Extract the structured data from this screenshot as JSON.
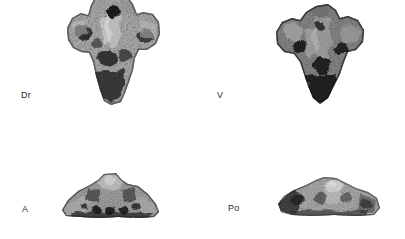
{
  "figure": {
    "type": "photographic-plate",
    "background_color": "#ffffff",
    "label_color": "#2b2b2b",
    "layout": "2 rows x 2 columns",
    "panels": [
      {
        "id": "dorsal",
        "label": "Dr",
        "view": "dorsal",
        "label_position": "left-of-specimen",
        "row": 1,
        "column": 1,
        "outline": "triangular, wide transverse processes at top, tapering ventrally",
        "tone": "mid-grey mottled, light highlights on ridges, dark pits",
        "crop": "top edge of specimen reaches image border"
      },
      {
        "id": "ventral",
        "label": "V",
        "view": "ventral",
        "label_position": "left-of-specimen",
        "row": 1,
        "column": 2,
        "outline": "triangular, broad lobed top, tapering to narrow base",
        "tone": "dark, coarse, heavily shadowed rugose surface",
        "crop": "fully contained"
      },
      {
        "id": "anterior",
        "label": "A",
        "view": "anterior",
        "label_position": "left-of-specimen",
        "row": 2,
        "column": 1,
        "outline": "wide low trapezoid, winged lateral processes, central dome",
        "tone": "mid-grey with dark circular foramina along lower margin",
        "crop": "fully contained"
      },
      {
        "id": "posterior",
        "label": "Po",
        "view": "posterior",
        "label_position": "left-of-specimen",
        "row": 2,
        "column": 2,
        "outline": "low wide arch, peaked centre, tapering lateral margins",
        "tone": "light-to-mid grey, bright highlight at apex, dark left margin",
        "crop": "fully contained"
      }
    ]
  }
}
